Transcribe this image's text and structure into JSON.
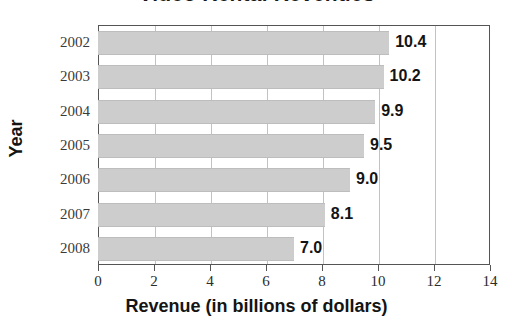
{
  "chart_data": {
    "type": "bar",
    "orientation": "horizontal",
    "title": "Video Rental Revenues",
    "xlabel": "Revenue (in billions of dollars)",
    "ylabel": "Year",
    "categories": [
      "2002",
      "2003",
      "2004",
      "2005",
      "2006",
      "2007",
      "2008"
    ],
    "values": [
      10.4,
      10.2,
      9.9,
      9.5,
      9.0,
      8.1,
      7.0
    ],
    "data_labels": [
      "10.4",
      "10.2",
      "9.9",
      "9.5",
      "9.0",
      "8.1",
      "7.0"
    ],
    "xlim": [
      0,
      14
    ],
    "xticks": [
      0,
      2,
      4,
      6,
      8,
      10,
      12,
      14
    ],
    "xtick_labels": [
      "0",
      "2",
      "4",
      "6",
      "8",
      "10",
      "12",
      "14"
    ],
    "grid": "vertical",
    "legend": null,
    "bar_color": "#cdcdcd",
    "grid_color": "#c2c2c2",
    "axis_color": "#555555",
    "text_color": "#141414"
  }
}
